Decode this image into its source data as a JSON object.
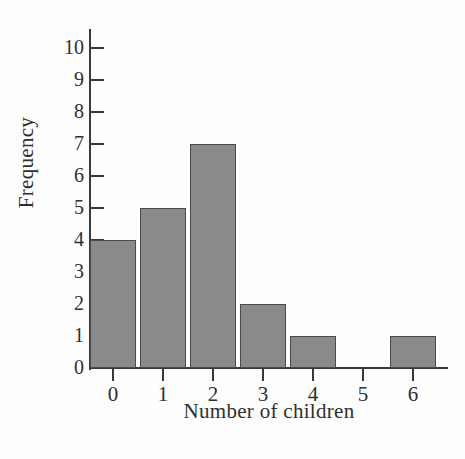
{
  "chart_data": {
    "type": "bar",
    "title": "",
    "xlabel": "Number of children",
    "ylabel": "Frequency",
    "categories": [
      "0",
      "1",
      "2",
      "3",
      "4",
      "5",
      "6"
    ],
    "values": [
      4,
      5,
      7,
      2,
      1,
      0,
      1
    ],
    "ylim": [
      0,
      10
    ],
    "ytick_labels": [
      "0",
      "1",
      "2",
      "3",
      "4",
      "5",
      "6",
      "7",
      "8",
      "9",
      "10"
    ],
    "ytick_values": [
      0,
      1,
      2,
      3,
      4,
      5,
      6,
      7,
      8,
      9,
      10
    ],
    "xtick_labels": [
      "0",
      "1",
      "2",
      "3",
      "4",
      "5",
      "6"
    ],
    "grid": false,
    "legend": false,
    "bar_color": "#8a8a8a",
    "bar_edge_color": "#4a4a4a",
    "axis_color": "#3a3a3a",
    "background_color": "#fdfdfd"
  }
}
